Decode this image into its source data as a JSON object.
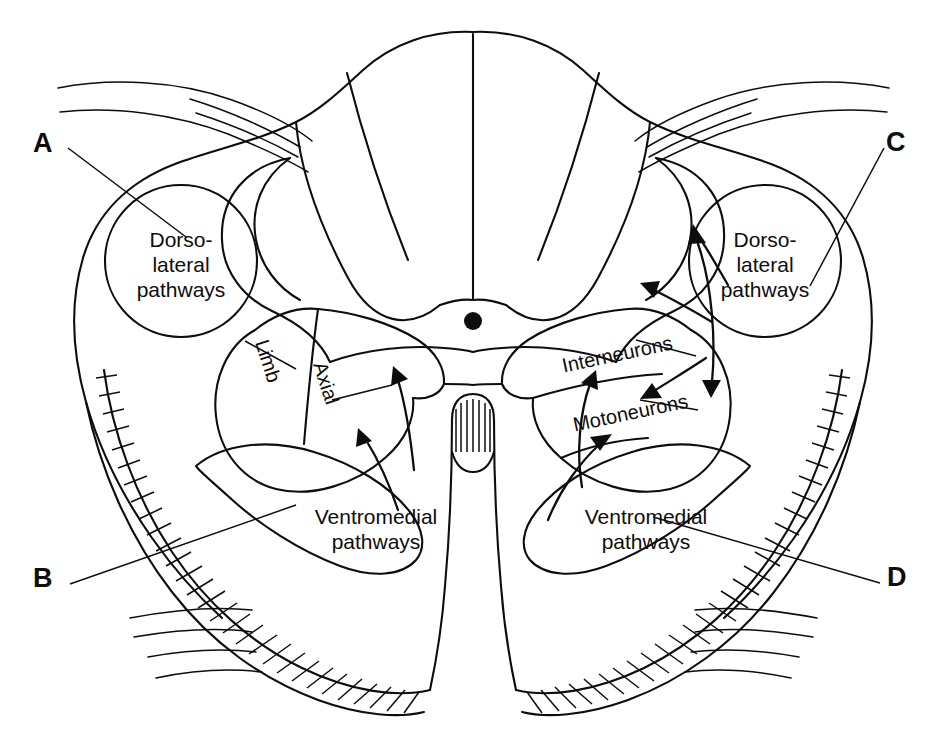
{
  "key_labels": [
    {
      "id": "A",
      "text": "A",
      "corner": "top-left"
    },
    {
      "id": "B",
      "text": "B",
      "corner": "bottom-left"
    },
    {
      "id": "C",
      "text": "C",
      "corner": "top-right"
    },
    {
      "id": "D",
      "text": "D",
      "corner": "bottom-right"
    }
  ],
  "regions": {
    "dorsolateral_left": {
      "line1": "Dorso-",
      "line2": "lateral",
      "line3": "pathways"
    },
    "dorsolateral_right": {
      "line1": "Dorso-",
      "line2": "lateral",
      "line3": "pathways"
    },
    "ventromedial_left": {
      "line1": "Ventromedial",
      "line2": "pathways"
    },
    "ventromedial_right": {
      "line1": "Ventromedial",
      "line2": "pathways"
    },
    "limb": {
      "text": "Limb"
    },
    "axial": {
      "text": "Axial"
    },
    "interneurons": {
      "text": "Interneurons"
    },
    "motoneurons": {
      "text": "Motoneurons"
    }
  },
  "anatomy": {
    "central_canal": "central-canal-dot",
    "dorsal_columns": "dorsal-column-fan",
    "ventral_fissure": "ventral-median-fissure",
    "white_matter_margin": "hatched-ventrolateral-margin",
    "dorsal_rootlets_left": 3,
    "dorsal_rootlets_right": 3,
    "ventral_rootlets_left": 4,
    "ventral_rootlets_right": 3
  },
  "colors": {
    "ink": "#0d0d0d",
    "background": "#ffffff"
  },
  "caption": {
    "fragment": ""
  }
}
